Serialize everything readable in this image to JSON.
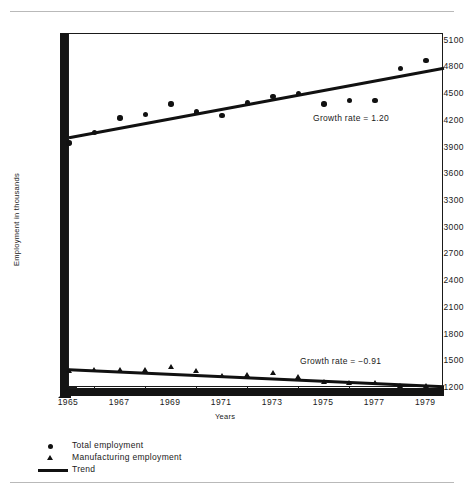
{
  "figure": {
    "title": "",
    "axis_title_y": "Employment in thousands",
    "axis_title_x": "Years"
  },
  "legend": {
    "position": "below-axis-left",
    "entries": [
      {
        "label": "Total employment",
        "marker": "circle-marker-icon"
      },
      {
        "label": "Manufacturing employment",
        "marker": "triangle-marker-icon"
      },
      {
        "label": "Trend",
        "marker": "line-marker-icon"
      }
    ]
  },
  "annotations": [
    {
      "id": "total",
      "text": "Growth rate = 1.20"
    },
    {
      "id": "manufacturing",
      "text": "Growth rate = −0.91"
    }
  ],
  "chart_data": {
    "type": "scatter",
    "title": "",
    "xlabel": "Years",
    "ylabel": "Employment in thousands",
    "xlim": [
      1965,
      1979.7
    ],
    "ylim": [
      1200,
      5175
    ],
    "grid": false,
    "legend_position": "below-axis-left",
    "xticks": [
      1965,
      1967,
      1969,
      1971,
      1973,
      1975,
      1977,
      1979
    ],
    "xticks_minor": [
      1966,
      1968,
      1970,
      1972,
      1974,
      1976,
      1978
    ],
    "yticks": [
      1200,
      1500,
      1800,
      2100,
      2400,
      2700,
      3000,
      3300,
      3600,
      3900,
      4200,
      4500,
      4800,
      5100
    ],
    "x": [
      1965,
      1966,
      1967,
      1968,
      1969,
      1970,
      1971,
      1972,
      1973,
      1974,
      1975,
      1976,
      1977,
      1978,
      1979
    ],
    "series": [
      {
        "name": "Total employment",
        "marker": "circle",
        "values": [
          3950,
          4070,
          4230,
          4270,
          4390,
          4300,
          4260,
          4400,
          4470,
          4510,
          4390,
          4430,
          4430,
          4790,
          4880
        ]
      },
      {
        "name": "Manufacturing employment",
        "marker": "triangle",
        "values": [
          1390,
          1400,
          1400,
          1400,
          1430,
          1390,
          1330,
          1340,
          1370,
          1320,
          1270,
          1250,
          1250,
          1215,
          1215
        ]
      },
      {
        "name": "Trend (Total employment)",
        "marker": "line",
        "trend_for": "Total employment",
        "growth_rate": 1.2,
        "endpoints": [
          {
            "x": 1965,
            "y": 4010
          },
          {
            "x": 1979.7,
            "y": 4790
          }
        ]
      },
      {
        "name": "Trend (Manufacturing employment)",
        "marker": "line",
        "trend_for": "Manufacturing employment",
        "growth_rate": -0.91,
        "endpoints": [
          {
            "x": 1965,
            "y": 1405
          },
          {
            "x": 1979.7,
            "y": 1215
          }
        ]
      }
    ]
  }
}
